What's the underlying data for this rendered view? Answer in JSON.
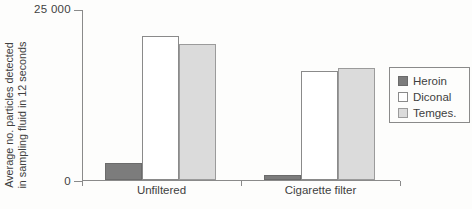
{
  "chart_data": {
    "type": "bar",
    "title": "",
    "ylabel_line1": "Average no. particles detected",
    "ylabel_line2": "in sampling fluid in 12 seconds",
    "categories": [
      "Unfiltered",
      "Cigarette filter"
    ],
    "series": [
      {
        "name": "Heroin",
        "fill": "#7c7c7c",
        "border": "#6b6b6b",
        "values": [
          2500,
          700
        ]
      },
      {
        "name": "Diconal",
        "fill": "#ffffff",
        "border": "#8a8a8a",
        "values": [
          21200,
          16100
        ]
      },
      {
        "name": "Temges.",
        "fill": "#dbdbdb",
        "border": "#9b9b9b",
        "values": [
          20000,
          16500
        ]
      }
    ],
    "ylim": [
      0,
      25000
    ],
    "yticks": [
      {
        "value": 25000,
        "label": "25 000"
      },
      {
        "value": 0,
        "label": "0"
      }
    ],
    "grid": false,
    "legend_position": "right",
    "axis_color": "#8a8a8a"
  }
}
